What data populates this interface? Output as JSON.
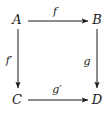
{
  "diagram": {
    "type": "commutative-square",
    "background_color": "#ffffff",
    "stroke_color": "#1a1a1a",
    "text_color": "#1a1a1a",
    "nodes": [
      {
        "id": "A",
        "label": "A",
        "x": 17,
        "y": 19,
        "position": "top-left"
      },
      {
        "id": "B",
        "label": "B",
        "x": 97,
        "y": 19,
        "position": "top-right"
      },
      {
        "id": "C",
        "label": "C",
        "x": 17,
        "y": 99,
        "position": "bottom-left"
      },
      {
        "id": "D",
        "label": "D",
        "x": 97,
        "y": 99,
        "position": "bottom-right"
      }
    ],
    "arrows": [
      {
        "id": "f",
        "label": "f",
        "from": "A",
        "to": "B",
        "direction": "right",
        "x1": 28,
        "y1": 21,
        "x2": 88,
        "y2": 21,
        "label_x": 55,
        "label_y": 11
      },
      {
        "id": "g",
        "label": "g",
        "from": "B",
        "to": "D",
        "direction": "down",
        "x1": 97,
        "y1": 29,
        "x2": 97,
        "y2": 88,
        "label_x": 87,
        "label_y": 61
      },
      {
        "id": "f-prime",
        "label": "f′",
        "from": "A",
        "to": "C",
        "direction": "down",
        "x1": 18,
        "y1": 29,
        "x2": 18,
        "y2": 88,
        "label_x": 9,
        "label_y": 60
      },
      {
        "id": "g-prime",
        "label": "g′",
        "from": "C",
        "to": "D",
        "direction": "right",
        "x1": 28,
        "y1": 100,
        "x2": 88,
        "y2": 100,
        "label_x": 57,
        "label_y": 89
      }
    ]
  }
}
